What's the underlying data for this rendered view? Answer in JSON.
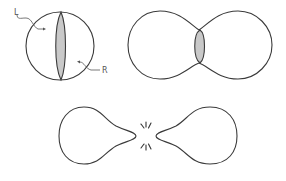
{
  "diagram": {
    "type": "cell-division-sequence",
    "stages": [
      {
        "id": "stage-1",
        "shape": "sphere",
        "description": "Sphere with a shaded division plane",
        "labels": [
          {
            "text": "L",
            "pointer": "left-region"
          },
          {
            "text": "R",
            "pointer": "right-region"
          }
        ]
      },
      {
        "id": "stage-2",
        "shape": "dumbbell",
        "description": "Pinched dumbbell with shaded constriction"
      },
      {
        "id": "stage-3",
        "shape": "separating-teardrops",
        "description": "Two teardrops separating with break marks"
      }
    ],
    "colors": {
      "outline": "#3a3a3a",
      "plane_fill": "#c9c9c9",
      "background": "#ffffff"
    }
  },
  "labels": {
    "left": "L",
    "right": "R"
  }
}
